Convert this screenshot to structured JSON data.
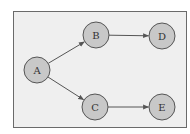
{
  "diagram": {
    "type": "directed-graph",
    "colors": {
      "background": "#ffffff",
      "frame_fill": "#efefef",
      "frame_stroke": "#6a6a6a",
      "node_fill": "#c8c8c8",
      "node_stroke": "#555555",
      "edge": "#555555",
      "label": "#333333"
    },
    "nodes": [
      {
        "id": "A",
        "label": "A",
        "cx": 37,
        "cy": 70
      },
      {
        "id": "B",
        "label": "B",
        "cx": 96,
        "cy": 35
      },
      {
        "id": "C",
        "label": "C",
        "cx": 95,
        "cy": 107
      },
      {
        "id": "D",
        "label": "D",
        "cx": 162,
        "cy": 36
      },
      {
        "id": "E",
        "label": "E",
        "cx": 162,
        "cy": 107
      }
    ],
    "edges": [
      {
        "from": "A",
        "to": "B"
      },
      {
        "from": "A",
        "to": "C"
      },
      {
        "from": "B",
        "to": "D"
      },
      {
        "from": "C",
        "to": "E"
      }
    ]
  }
}
